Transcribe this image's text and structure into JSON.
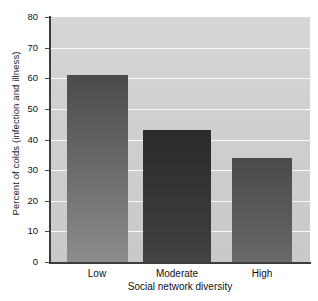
{
  "chart_data": {
    "type": "bar",
    "title": "",
    "xlabel": "Social network diversity",
    "ylabel": "Percent of colds (infection and illness)",
    "categories": [
      "Low",
      "Moderate",
      "High"
    ],
    "values": [
      61,
      43,
      34
    ],
    "ylim": [
      0,
      80
    ],
    "yticks": [
      0,
      10,
      20,
      30,
      40,
      50,
      60,
      70,
      80
    ],
    "ytick_labels": [
      "0",
      "10",
      "20",
      "30",
      "40",
      "50",
      "60",
      "70",
      "80"
    ],
    "grid": true,
    "gridlines_axis": "y",
    "legend": null,
    "series": [
      {
        "name": "Percent of colds",
        "values": [
          61,
          43,
          34
        ]
      }
    ],
    "colors": {
      "plot_background": "#cfcfcf",
      "gridline": "#fbfbfb",
      "axis": "#3d3d3d",
      "bar_low": "#616161",
      "bar_moderate": "#333333",
      "bar_high": "#565656",
      "text": "#111111",
      "page_background": "#ffffff"
    }
  }
}
